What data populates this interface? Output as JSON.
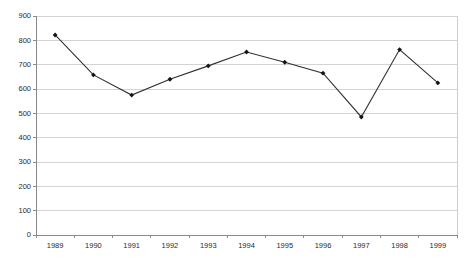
{
  "chart_data": {
    "type": "line",
    "title": "",
    "subtitle": "",
    "xlabel": "",
    "ylabel": "",
    "categories": [
      "1989",
      "1990",
      "1991",
      "1992",
      "1993",
      "1994",
      "1995",
      "1996",
      "1997",
      "1998",
      "1999"
    ],
    "values": [
      822,
      658,
      575,
      640,
      695,
      752,
      710,
      665,
      485,
      762,
      625
    ],
    "series": [
      {
        "name": "",
        "values": [
          822,
          658,
          575,
          640,
          695,
          752,
          710,
          665,
          485,
          762,
          625
        ]
      }
    ],
    "ylim": [
      0,
      900
    ],
    "ytick_values": [
      0,
      100,
      200,
      300,
      400,
      500,
      600,
      700,
      800,
      900
    ],
    "ytick_labels": [
      "0",
      "100",
      "200",
      "300",
      "400",
      "500",
      "600",
      "700",
      "800",
      "900"
    ],
    "xtick_labels": [
      "1989",
      "1990",
      "1991",
      "1992",
      "1993",
      "1994",
      "1995",
      "1996",
      "1997",
      "1998",
      "1999"
    ],
    "grid": true,
    "grid_axis": "y",
    "legend": false,
    "legend_position": "none",
    "marker": "diamond",
    "line_color": "#303030",
    "marker_color": "#151515",
    "grid_color": "#c8c8c8",
    "axis_color": "#8a8a8a",
    "background_color": "#ffffff"
  },
  "plot_geometry": {
    "left": 36,
    "right": 457,
    "top": 16,
    "bottom": 235
  }
}
